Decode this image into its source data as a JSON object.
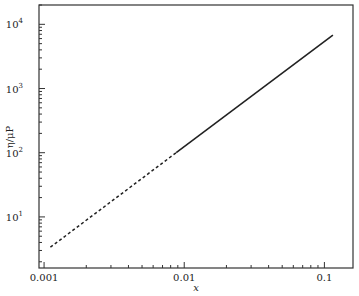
{
  "chart_data": {
    "type": "line",
    "title": "",
    "xlabel": "x",
    "ylabel": "η/μP",
    "xscale": "log",
    "yscale": "log",
    "xlim": [
      0.00092,
      0.16
    ],
    "ylim": [
      1.6,
      20000
    ],
    "grid": false,
    "legend": null,
    "x_ticks": [
      {
        "value": 0.001,
        "label": "0.001"
      },
      {
        "value": 0.01,
        "label": "0.01"
      },
      {
        "value": 0.1,
        "label": "0.1"
      }
    ],
    "y_ticks": [
      {
        "value": 10,
        "base": "10",
        "exp": "1"
      },
      {
        "value": 100,
        "base": "10",
        "exp": "2"
      },
      {
        "value": 1000,
        "base": "10",
        "exp": "3"
      },
      {
        "value": 10000,
        "base": "10",
        "exp": "4"
      }
    ],
    "series": [
      {
        "name": "extrapolated",
        "style": "dashed",
        "color": "#222222",
        "x": [
          0.00111,
          0.00877
        ],
        "y": [
          3.37,
          100
        ]
      },
      {
        "name": "measured",
        "style": "solid",
        "color": "#222222",
        "x": [
          0.00877,
          0.115
        ],
        "y": [
          100,
          6800
        ]
      }
    ]
  }
}
